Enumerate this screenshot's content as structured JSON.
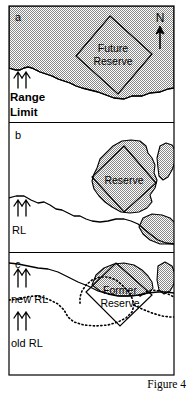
{
  "figure": {
    "caption": "Figure 4",
    "compass_label": "N",
    "fill_color": "#b3b3b3",
    "line_color": "#000000",
    "background_color": "#ffffff"
  },
  "panels": [
    {
      "id": "a",
      "label": "a",
      "reserve_label_line1": "Future",
      "reserve_label_line2": "Reserve",
      "annotations": [
        {
          "name": "range-limit",
          "line1": "Range",
          "line2": "Limit",
          "arrows": 2
        }
      ]
    },
    {
      "id": "b",
      "label": "b",
      "reserve_label_line1": "Reserve",
      "reserve_label_line2": "",
      "annotations": [
        {
          "name": "range-limit",
          "line1": "RL",
          "line2": "",
          "arrows": 2
        }
      ]
    },
    {
      "id": "c",
      "label": "c",
      "reserve_label_line1": "Former",
      "reserve_label_line2": "Reserve",
      "annotations": [
        {
          "name": "new-range-limit",
          "line1": "new RL",
          "line2": "",
          "arrows": 2
        },
        {
          "name": "old-range-limit",
          "line1": "old RL",
          "line2": "",
          "arrows": 2
        }
      ]
    }
  ]
}
